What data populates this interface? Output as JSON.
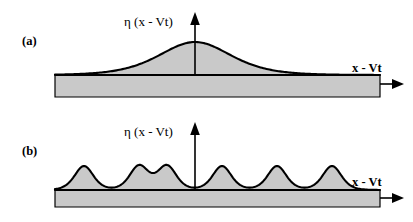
{
  "figure": {
    "background_color": "#ffffff",
    "fill_color": "#c9c9c9",
    "line_color": "#000000",
    "width": 413,
    "height": 222
  },
  "panels": [
    {
      "id": "a",
      "label": "(a)",
      "y_axis_label": "η (x - Vt)",
      "x_axis_label": "x - Vt",
      "wave_type": "solitary wave (sech² soliton)",
      "peak_count": 1
    },
    {
      "id": "b",
      "label": "(b)",
      "y_axis_label": "η (x - Vt)",
      "x_axis_label": "x - Vt",
      "wave_type": "periodic cnoidal wave train",
      "peak_count": 6
    }
  ],
  "chart_data": {
    "type": "line",
    "title": "",
    "xlabel": "x - Vt",
    "ylabel": "η (x - Vt)",
    "grid": false,
    "legend": "none",
    "panels": [
      {
        "id": "a",
        "label": "(a)",
        "description": "Single localized hump of elevation on a uniform fluid layer; profile is a sech-squared solitary wave centred on the vertical axis.",
        "profile": "sech2",
        "amplitude": 33,
        "width_parameter": 48,
        "center_x": 195,
        "baseline_y": 75,
        "substrate_left": 55,
        "substrate_right": 380,
        "substrate_bottom": 97,
        "axis_origin_x": 195,
        "axis_top_y": 14,
        "axis_arrow_x_end": 402
      },
      {
        "id": "b",
        "label": "(b)",
        "description": "Train of six identical crests with broad flat troughs; periodic cnoidal wave solution.",
        "profile": "cnoidal",
        "amplitude": 24,
        "wavelength": 55,
        "crest_width": 30,
        "baseline_y": 80,
        "substrate_left": 55,
        "substrate_right": 380,
        "substrate_bottom": 97,
        "axis_origin_x": 195,
        "axis_top_y": 14,
        "axis_arrow_x_end": 402,
        "crest_centers": [
          84,
          139,
          167,
          222,
          277,
          332
        ]
      }
    ]
  }
}
